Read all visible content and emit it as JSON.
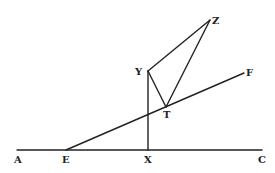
{
  "diagram": {
    "type": "geometric-figure",
    "colors": {
      "ink": "#222222",
      "background": "#ffffff"
    },
    "points": {
      "A": {
        "x": 17,
        "y": 150
      },
      "E": {
        "x": 66,
        "y": 150
      },
      "X": {
        "x": 148,
        "y": 150
      },
      "C": {
        "x": 262,
        "y": 150
      },
      "F": {
        "x": 244,
        "y": 73
      },
      "Y": {
        "x": 148,
        "y": 71
      },
      "T": {
        "x": 166,
        "y": 107
      },
      "Z": {
        "x": 210,
        "y": 20
      }
    },
    "segments": [
      {
        "from": "A",
        "to": "C"
      },
      {
        "from": "E",
        "to": "F"
      },
      {
        "from": "X",
        "to": "Y"
      },
      {
        "from": "Y",
        "to": "Z"
      },
      {
        "from": "Y",
        "to": "T"
      },
      {
        "from": "T",
        "to": "Z"
      }
    ],
    "labels": {
      "A": "A",
      "E": "E",
      "X": "X",
      "C": "C",
      "F": "F",
      "Y": "Y",
      "T": "T",
      "Z": "Z"
    }
  }
}
